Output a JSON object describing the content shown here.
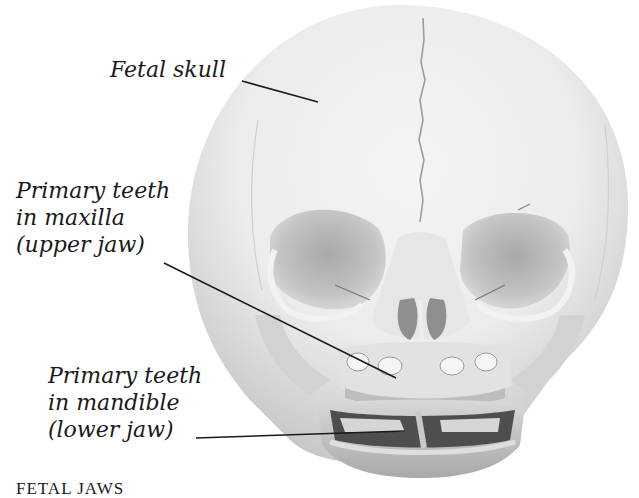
{
  "figure": {
    "labels": {
      "fetal_skull": {
        "text": "Fetal skull"
      },
      "maxilla": {
        "lines": [
          "Primary teeth",
          "in maxilla",
          "(upper jaw)"
        ]
      },
      "mandible": {
        "lines": [
          "Primary teeth",
          "in mandible",
          "(lower jaw)"
        ]
      }
    },
    "caption": "FETAL JAWS",
    "colors": {
      "background": "#ffffff",
      "bone_light": "#ececec",
      "bone_mid": "#c8c8c8",
      "bone_shadow": "#8a8a8a",
      "cavity_dark": "#4a4a4a",
      "leader_line": "#1a1a1a"
    }
  }
}
